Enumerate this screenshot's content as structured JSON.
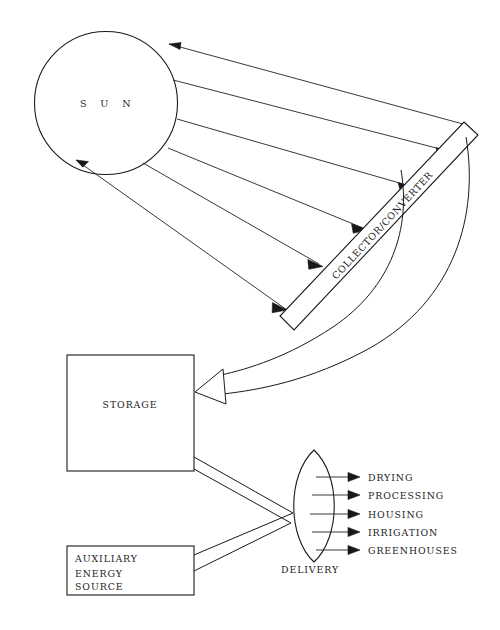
{
  "diagram": {
    "colors": {
      "background": "#ffffff",
      "stroke": "#1a1a1a",
      "text": "#1c1c1c",
      "arrowhead_fill": "#181818",
      "hollow_arrowhead_fill": "#ffffff"
    },
    "nodes": {
      "sun": {
        "label": "S U N",
        "shape": "circle",
        "cx": 106,
        "cy": 103,
        "r": 72
      },
      "collector": {
        "label": "COLLECTOR/CONVERTER",
        "shape": "rotated-bar",
        "rotation_deg": -58
      },
      "storage": {
        "label": "STORAGE",
        "shape": "rectangle",
        "x": 67,
        "y": 355,
        "width": 127,
        "height": 116
      },
      "auxiliary": {
        "label_lines": [
          "AUXILIARY",
          "ENERGY",
          "SOURCE"
        ],
        "shape": "rectangle",
        "x": 67,
        "y": 546,
        "width": 127,
        "height": 49
      },
      "delivery": {
        "label": "DELIVERY",
        "shape": "lens"
      }
    },
    "outputs": [
      {
        "label": "DRYING"
      },
      {
        "label": "PROCESSING"
      },
      {
        "label": "HOUSING"
      },
      {
        "label": "IRRIGATION"
      },
      {
        "label": "GREENHOUSES"
      }
    ],
    "flows": [
      {
        "from": "sun",
        "to": "collector",
        "kind": "solar-ray",
        "count": 6
      },
      {
        "from": "collector",
        "to": "storage",
        "kind": "double-line-curve",
        "arrowhead": "hollow"
      },
      {
        "from": "storage",
        "to": "delivery",
        "kind": "double-line"
      },
      {
        "from": "auxiliary",
        "to": "delivery",
        "kind": "double-line"
      },
      {
        "from": "delivery",
        "to": "outputs",
        "kind": "single-arrow",
        "count": 5
      }
    ]
  }
}
